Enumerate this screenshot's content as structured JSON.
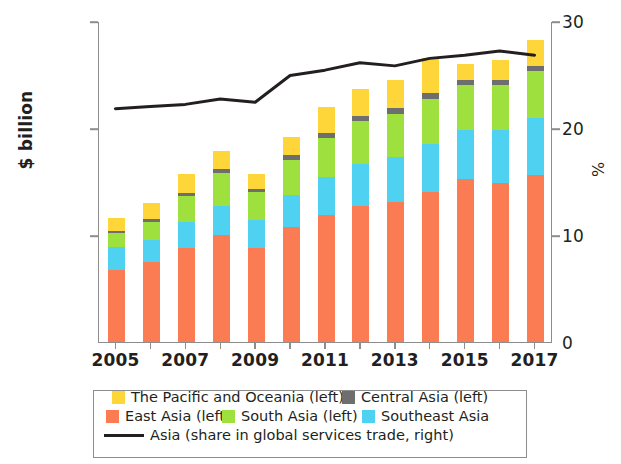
{
  "chart_data": {
    "type": "bar",
    "title": "",
    "subtitle": "",
    "xlabel": "",
    "ylabel": "$ billion",
    "ylabel_right": "%",
    "ylim": [
      0,
      3000
    ],
    "ylim_right": [
      0,
      30
    ],
    "yticks": [
      "0",
      "1,000",
      "2,000",
      "3,000"
    ],
    "ytick_values": [
      0,
      1000,
      2000,
      3000
    ],
    "yticks_right": [
      "0",
      "10",
      "20",
      "30"
    ],
    "ytick_values_right": [
      0,
      10,
      20,
      30
    ],
    "grid": false,
    "legend_position": "bottom",
    "stacked": true,
    "categories": [
      2005,
      2006,
      2007,
      2008,
      2009,
      2010,
      2011,
      2012,
      2013,
      2014,
      2015,
      2016,
      2017
    ],
    "xtick_labels": [
      "2005",
      "2007",
      "2009",
      "2011",
      "2013",
      "2015",
      "2017"
    ],
    "xtick_values": [
      2005,
      2007,
      2009,
      2011,
      2013,
      2015,
      2017
    ],
    "series": [
      {
        "name": "East Asia (left)",
        "axis": "left",
        "color": "#fb7b52",
        "values": [
          670,
          745,
          880,
          1000,
          880,
          1075,
          1190,
          1275,
          1305,
          1400,
          1520,
          1490,
          1560
        ]
      },
      {
        "name": "Southeast Asia",
        "axis": "left",
        "color": "#4fd2f2",
        "values": [
          215,
          205,
          240,
          275,
          260,
          300,
          350,
          390,
          420,
          450,
          465,
          490,
          530
        ]
      },
      {
        "name": "South Asia (left)",
        "axis": "left",
        "color": "#9ee03e",
        "values": [
          130,
          170,
          240,
          305,
          260,
          330,
          370,
          400,
          410,
          425,
          415,
          420,
          440
        ]
      },
      {
        "name": "Central Asia (left)",
        "axis": "left",
        "color": "#6e6e6e",
        "values": [
          22,
          28,
          30,
          36,
          34,
          40,
          44,
          48,
          50,
          52,
          48,
          46,
          50
        ]
      },
      {
        "name": "The Pacific and Oceania (left)",
        "axis": "left",
        "color": "#ffd63a",
        "values": [
          118,
          152,
          180,
          170,
          138,
          175,
          245,
          250,
          260,
          330,
          150,
          185,
          245
        ]
      },
      {
        "name": "Asia (share in global services trade, right)",
        "axis": "right",
        "type": "line",
        "color": "#231f20",
        "values": [
          21.9,
          22.1,
          22.3,
          22.8,
          22.5,
          25.0,
          25.5,
          26.2,
          25.9,
          26.6,
          26.9,
          27.3,
          26.9
        ]
      }
    ]
  },
  "legend": {
    "rows": [
      [
        {
          "label": "The Pacific and Oceania (left)",
          "swatch": "#ffd63a",
          "kind": "box"
        },
        {
          "label": "Central Asia (left)",
          "swatch": "#6e6e6e",
          "kind": "box"
        }
      ],
      [
        {
          "label": "East Asia (left)",
          "swatch": "#fb7b52",
          "kind": "box"
        },
        {
          "label": "South Asia (left)",
          "swatch": "#9ee03e",
          "kind": "box"
        },
        {
          "label": "Southeast Asia",
          "swatch": "#4fd2f2",
          "kind": "box"
        }
      ],
      [
        {
          "label": "Asia (share in global services trade, right)",
          "swatch": "#231f20",
          "kind": "line"
        }
      ]
    ]
  },
  "axes": {
    "left_title": "$ billion",
    "right_title": "%"
  },
  "colors": {
    "axis": "#8d8d8d",
    "text": "#231f20",
    "background": "#ffffff"
  }
}
